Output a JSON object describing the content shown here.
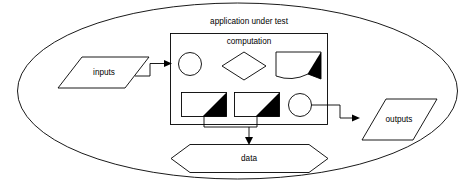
{
  "diagram": {
    "type": "flow-diagram",
    "title": "application under test",
    "boundary": {
      "label": "application under test",
      "shape": "ellipse"
    },
    "container": {
      "label": "computation",
      "shape": "rectangle"
    },
    "nodes": {
      "inputs": {
        "label": "inputs",
        "shape": "parallelogram"
      },
      "outputs": {
        "label": "outputs",
        "shape": "parallelogram"
      },
      "data": {
        "label": "data",
        "shape": "hexagon"
      },
      "entry_circle": {
        "label": "",
        "shape": "circle"
      },
      "decision_diamond": {
        "label": "",
        "shape": "diamond"
      },
      "wedge_component": {
        "label": "",
        "shape": "curved-rectangle-with-black-triangle"
      },
      "component_one": {
        "label": "",
        "shape": "rectangle-with-black-triangle"
      },
      "component_two": {
        "label": "",
        "shape": "rectangle-with-black-triangle"
      },
      "exit_circle": {
        "label": "",
        "shape": "circle"
      }
    },
    "connectors": [
      {
        "name": "inputs-to-entry-circle",
        "from": "inputs",
        "to": "entry_circle",
        "arrow": true
      },
      {
        "name": "exit-circle-to-outputs",
        "from": "exit_circle",
        "to": "outputs",
        "arrow": true
      },
      {
        "name": "component-one-to-data",
        "from": "component_one",
        "to": "data",
        "arrow": true
      },
      {
        "name": "component-two-to-data",
        "from": "component_two",
        "to": "data",
        "arrow": true
      }
    ],
    "colors": {
      "stroke": "#000000",
      "fill": "#ffffff",
      "accent": "#000000"
    }
  }
}
